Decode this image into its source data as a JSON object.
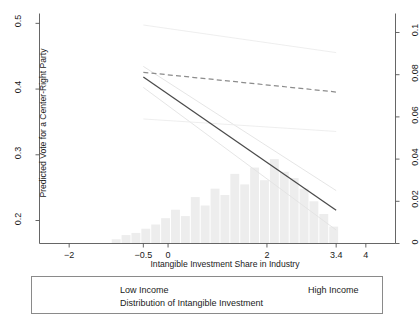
{
  "chart_data": {
    "type": "line",
    "title": "",
    "xlabel": "Intangible Investment Share in Industry",
    "ylabel": "Predicted Vote for a Center-Right Party",
    "ylabel_right": "",
    "xlim": [
      -2.6,
      4.6
    ],
    "ylim": [
      0.165,
      0.515
    ],
    "ylim_right": [
      0,
      0.109
    ],
    "xticks": [
      "-2",
      "-0.5",
      "0",
      "2",
      "3.4",
      "4"
    ],
    "xtick_values": [
      -2,
      -0.5,
      0,
      2,
      3.4,
      4
    ],
    "yticks_left": [
      "0.2",
      "0.3",
      "0.4",
      "0.5"
    ],
    "ytick_values_left": [
      0.2,
      0.3,
      0.4,
      0.5
    ],
    "yticks_right": [
      "0",
      "0.02",
      "0.04",
      "0.06",
      "0.08",
      "0.1"
    ],
    "ytick_values_right": [
      0,
      0.02,
      0.04,
      0.06,
      0.08,
      0.1
    ],
    "grid": false,
    "legend_position": "below-plot",
    "series": [
      {
        "name": "Low Income",
        "style": "solid",
        "color": "#4a4a4a",
        "x": [
          -0.5,
          3.4
        ],
        "values": [
          0.4185,
          0.2155
        ]
      },
      {
        "name": "High Income",
        "style": "dashed",
        "color": "#8c8c8c",
        "x": [
          -0.5,
          3.4
        ],
        "values": [
          0.4255,
          0.3955
        ]
      },
      {
        "name": "Low Income upper CI",
        "style": "solid-faint",
        "color": "#e2e2e2",
        "x": [
          -0.5,
          3.4
        ],
        "values": [
          0.4345,
          0.2455
        ]
      },
      {
        "name": "Low Income lower CI",
        "style": "solid-faint",
        "color": "#e2e2e2",
        "x": [
          -0.5,
          3.4
        ],
        "values": [
          0.4025,
          0.1855
        ]
      },
      {
        "name": "High Income upper CI",
        "style": "solid-faint",
        "color": "#ececec",
        "x": [
          -0.5,
          3.4
        ],
        "values": [
          0.4975,
          0.4555
        ]
      },
      {
        "name": "High Income lower CI",
        "style": "solid-faint",
        "color": "#ececec",
        "x": [
          -0.5,
          3.4
        ],
        "values": [
          0.3545,
          0.3355
        ]
      }
    ],
    "histogram": {
      "name": "Distribution of Intangible Investment",
      "color": "#ededed",
      "bin_centers": [
        -1.05,
        -0.85,
        -0.65,
        -0.45,
        -0.25,
        -0.05,
        0.15,
        0.35,
        0.55,
        0.75,
        0.95,
        1.15,
        1.35,
        1.55,
        1.75,
        1.95,
        2.15,
        2.35,
        2.55,
        2.75,
        2.95,
        3.15,
        3.35
      ],
      "values": [
        0.002,
        0.004,
        0.005,
        0.007,
        0.009,
        0.012,
        0.016,
        0.013,
        0.022,
        0.018,
        0.026,
        0.023,
        0.033,
        0.028,
        0.036,
        0.03,
        0.04,
        0.034,
        0.031,
        0.026,
        0.02,
        0.014,
        0.008
      ]
    }
  },
  "legend": {
    "items": [
      {
        "label": "Low Income",
        "style": "solid"
      },
      {
        "label": "High Income",
        "style": "dashed"
      },
      {
        "label": "Distribution of Intangible Investment",
        "style": "none"
      }
    ]
  },
  "axes": {
    "x_title": "Intangible Investment Share in Industry",
    "y_title": "Predicted Vote for a Center-Right Party"
  }
}
